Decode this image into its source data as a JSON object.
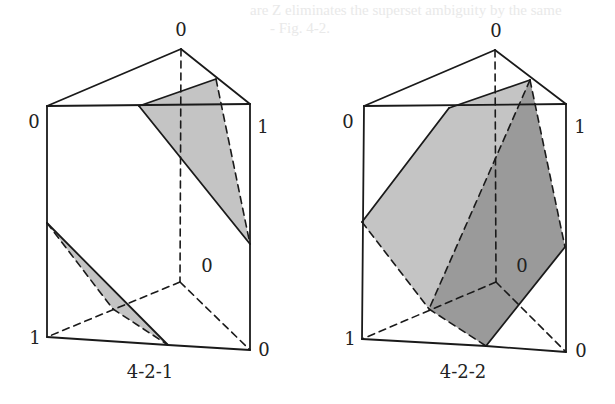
{
  "bleed_text": {
    "line1": "are Z eliminates the superset ambiguity by the same",
    "line2": "- Fig. 4-2."
  },
  "style": {
    "stroke": "#1a1a1a",
    "shade_light": "#c4c4c4",
    "shade_dark": "#9a9a9a",
    "shade_mid": "#b3b3b3"
  },
  "figures": [
    {
      "id": "4-2-1",
      "caption": "4-2-1",
      "caption_pos": [
        150,
        378
      ],
      "vertices": {
        "top_back": [
          181,
          49
        ],
        "top_left": [
          47,
          106
        ],
        "top_right": [
          250,
          104
        ],
        "bottom_back": [
          180,
          282
        ],
        "bottom_left": [
          47,
          337
        ],
        "bottom_right": [
          250,
          350
        ]
      },
      "labels": [
        {
          "text": "0",
          "x": 181,
          "y": 36
        },
        {
          "text": "0",
          "x": 34,
          "y": 128
        },
        {
          "text": "1",
          "x": 263,
          "y": 133
        },
        {
          "text": "0",
          "x": 207,
          "y": 272
        },
        {
          "text": "1",
          "x": 35,
          "y": 344
        },
        {
          "text": "0",
          "x": 264,
          "y": 356
        }
      ],
      "shaded_regions": [
        {
          "points": "139,106 216,79 250,244",
          "fill": "shade_light"
        },
        {
          "points": "47,223 168,345 113,309",
          "fill": "shade_light"
        }
      ],
      "solid_lines": [
        [
          47,
          106,
          181,
          49
        ],
        [
          181,
          49,
          250,
          104
        ],
        [
          47,
          106,
          250,
          104
        ],
        [
          47,
          106,
          47,
          337
        ],
        [
          250,
          104,
          250,
          350
        ],
        [
          47,
          337,
          168,
          345
        ],
        [
          168,
          345,
          250,
          350
        ],
        [
          139,
          106,
          216,
          79
        ],
        [
          139,
          106,
          250,
          244
        ],
        [
          47,
          223,
          168,
          345
        ]
      ],
      "dashed_lines": [
        [
          181,
          49,
          180,
          282
        ],
        [
          180,
          282,
          47,
          337
        ],
        [
          180,
          282,
          250,
          350
        ],
        [
          216,
          79,
          250,
          244
        ],
        [
          47,
          223,
          113,
          309
        ],
        [
          113,
          309,
          168,
          345
        ]
      ]
    },
    {
      "id": "4-2-2",
      "caption": "4-2-2",
      "caption_pos": [
        463,
        378
      ],
      "vertices": {
        "top_back": [
          495,
          50
        ],
        "top_left": [
          364,
          106
        ],
        "top_right": [
          566,
          104
        ],
        "bottom_back": [
          496,
          282
        ],
        "bottom_left": [
          362,
          339
        ],
        "bottom_right": [
          566,
          352
        ]
      },
      "labels": [
        {
          "text": "0",
          "x": 496,
          "y": 37
        },
        {
          "text": "0",
          "x": 348,
          "y": 128
        },
        {
          "text": "1",
          "x": 580,
          "y": 133
        },
        {
          "text": "0",
          "x": 522,
          "y": 272
        },
        {
          "text": "1",
          "x": 350,
          "y": 345
        },
        {
          "text": "0",
          "x": 581,
          "y": 357
        }
      ],
      "shaded_regions": [
        {
          "points": "449,108 530,80 565,247 486,346 429,309 362,222",
          "fill": "shade_light"
        },
        {
          "points": "530,80 565,247 486,346 429,309",
          "fill": "shade_dark"
        }
      ],
      "solid_lines": [
        [
          364,
          106,
          495,
          50
        ],
        [
          495,
          50,
          566,
          104
        ],
        [
          364,
          106,
          566,
          104
        ],
        [
          364,
          106,
          362,
          339
        ],
        [
          566,
          104,
          566,
          352
        ],
        [
          362,
          339,
          486,
          346
        ],
        [
          486,
          346,
          566,
          352
        ],
        [
          449,
          108,
          530,
          80
        ],
        [
          449,
          108,
          362,
          222
        ],
        [
          565,
          247,
          486,
          346
        ]
      ],
      "dashed_lines": [
        [
          495,
          50,
          496,
          282
        ],
        [
          496,
          282,
          362,
          339
        ],
        [
          496,
          282,
          566,
          352
        ],
        [
          530,
          80,
          429,
          309
        ],
        [
          530,
          80,
          565,
          247
        ],
        [
          362,
          222,
          429,
          309
        ],
        [
          429,
          309,
          486,
          346
        ]
      ]
    }
  ]
}
